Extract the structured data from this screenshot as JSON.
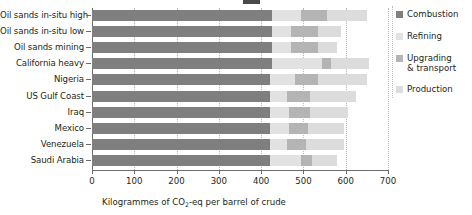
{
  "chart_data": {
    "type": "bar",
    "orientation": "horizontal",
    "stacked": true,
    "title": "",
    "xlabel": "Kilogrammes of CO2-eq per barrel of crude",
    "xlabel_parts": {
      "pre": "Kilogrammes of CO",
      "sub": "2",
      "post": "-eq per barrel of crude"
    },
    "ylabel": "",
    "xlim": [
      0,
      700
    ],
    "xticks": [
      0,
      100,
      200,
      300,
      400,
      500,
      600,
      700
    ],
    "xticklabels": [
      "0",
      "100",
      "200",
      "300",
      "400",
      "500",
      "600",
      "700"
    ],
    "grid": true,
    "grid_axis": "x",
    "grid_style": "dotted",
    "legend_position": "right",
    "categories": [
      "Oil sands in-situ high",
      "Oil sands in-situ low",
      "Oil sands mining",
      "California heavy",
      "Nigeria",
      "US Gulf Coast",
      "Iraq",
      "Mexico",
      "Venezuela",
      "Saudi Arabia"
    ],
    "series": [
      {
        "name": "Combustion",
        "color": "#807f7f",
        "values": [
          425,
          425,
          425,
          425,
          420,
          420,
          420,
          420,
          420,
          420
        ]
      },
      {
        "name": "Refining",
        "color": "#e2e2e2",
        "values": [
          70,
          45,
          45,
          120,
          60,
          40,
          45,
          45,
          40,
          75
        ]
      },
      {
        "name": "Upgrading & transport",
        "color": "#b4b4b4",
        "values": [
          60,
          65,
          65,
          20,
          55,
          55,
          50,
          45,
          45,
          25
        ]
      },
      {
        "name": "Production",
        "color": "#dcdcdc",
        "values": [
          95,
          55,
          45,
          90,
          115,
          110,
          90,
          85,
          90,
          60
        ]
      }
    ],
    "totals": [
      650,
      590,
      580,
      655,
      650,
      625,
      605,
      595,
      595,
      580
    ]
  },
  "legend": {
    "items": [
      {
        "label": "Combustion",
        "color": "#807f7f"
      },
      {
        "label": "Refining",
        "color": "#e2e2e2"
      },
      {
        "label": "Upgrading",
        "label2": "& transport",
        "color": "#b4b4b4"
      },
      {
        "label": "Production",
        "color": "#dcdcdc"
      }
    ]
  },
  "colors": {
    "combustion": "#807f7f",
    "refining": "#e2e2e2",
    "upgrading": "#b4b4b4",
    "production": "#dcdcdc",
    "axis": "#6d6d6d",
    "grid": "#b9b9b9",
    "text": "#231f20",
    "background": "#ffffff"
  }
}
